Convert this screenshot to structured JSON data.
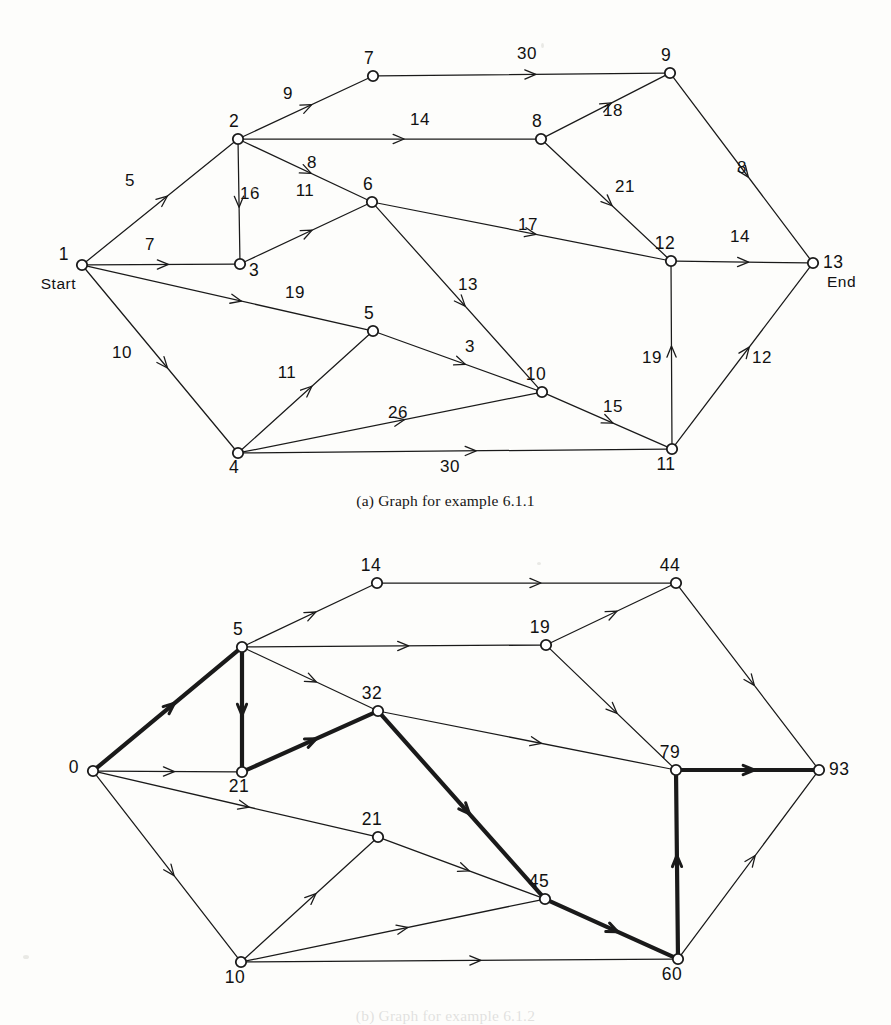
{
  "page": {
    "background_color": "#fdfdfb",
    "ink_color": "#1a1a1a",
    "width": 891,
    "height": 1025
  },
  "figure_a": {
    "caption": "(a) Graph for example 6.1.1",
    "terminal_labels": {
      "start": "Start",
      "end": "End"
    },
    "nodes": [
      {
        "id": "1",
        "label": "1",
        "x": 82,
        "y": 265,
        "label_dx": -13,
        "label_dy": -5,
        "terminal": "Start"
      },
      {
        "id": "2",
        "label": "2",
        "x": 238,
        "y": 139,
        "label_dx": -4,
        "label_dy": -12
      },
      {
        "id": "3",
        "label": "3",
        "x": 240,
        "y": 264,
        "label_dx": 9,
        "label_dy": 12
      },
      {
        "id": "4",
        "label": "4",
        "x": 238,
        "y": 453,
        "label_dx": -4,
        "label_dy": 20
      },
      {
        "id": "5",
        "label": "5",
        "x": 373,
        "y": 331,
        "label_dx": -4,
        "label_dy": -12
      },
      {
        "id": "6",
        "label": "6",
        "x": 372,
        "y": 202,
        "label_dx": -4,
        "label_dy": -12
      },
      {
        "id": "7",
        "label": "7",
        "x": 373,
        "y": 76,
        "label_dx": -4,
        "label_dy": -12
      },
      {
        "id": "8",
        "label": "8",
        "x": 541,
        "y": 139,
        "label_dx": -4,
        "label_dy": -12
      },
      {
        "id": "9",
        "label": "9",
        "x": 670,
        "y": 73,
        "label_dx": -4,
        "label_dy": -12
      },
      {
        "id": "10",
        "label": "10",
        "x": 542,
        "y": 392,
        "label_dx": -6,
        "label_dy": -12
      },
      {
        "id": "11",
        "label": "11",
        "x": 672,
        "y": 449,
        "label_dx": -6,
        "label_dy": 21
      },
      {
        "id": "12",
        "label": "12",
        "x": 671,
        "y": 261,
        "label_dx": -6,
        "label_dy": -12
      },
      {
        "id": "13",
        "label": "13",
        "x": 813,
        "y": 263,
        "label_dx": 10,
        "label_dy": 5,
        "terminal": "End"
      }
    ],
    "edges": [
      {
        "from": "1",
        "to": "2",
        "weight": "5",
        "wx": 130,
        "wy": 186
      },
      {
        "from": "1",
        "to": "3",
        "weight": "7",
        "wx": 150,
        "wy": 250
      },
      {
        "from": "1",
        "to": "5",
        "weight": "19",
        "wx": 295,
        "wy": 298
      },
      {
        "from": "1",
        "to": "4",
        "weight": "10",
        "wx": 122,
        "wy": 358
      },
      {
        "from": "2",
        "to": "7",
        "weight": "9",
        "wx": 288,
        "wy": 99
      },
      {
        "from": "2",
        "to": "8",
        "weight": "14",
        "wx": 420,
        "wy": 125
      },
      {
        "from": "2",
        "to": "6",
        "weight": "8",
        "wx": 312,
        "wy": 168
      },
      {
        "from": "2",
        "to": "3",
        "weight": "16",
        "wx": 250,
        "wy": 199
      },
      {
        "from": "3",
        "to": "6",
        "weight": "11",
        "wx": 305,
        "wy": 196
      },
      {
        "from": "4",
        "to": "5",
        "weight": "11",
        "wx": 287,
        "wy": 378
      },
      {
        "from": "4",
        "to": "10",
        "weight": "26",
        "wx": 398,
        "wy": 418
      },
      {
        "from": "4",
        "to": "11",
        "weight": "30",
        "wx": 450,
        "wy": 472
      },
      {
        "from": "5",
        "to": "10",
        "weight": "3",
        "wx": 470,
        "wy": 352
      },
      {
        "from": "6",
        "to": "12",
        "weight": "17",
        "wx": 528,
        "wy": 230
      },
      {
        "from": "6",
        "to": "10",
        "weight": "13",
        "wx": 468,
        "wy": 290
      },
      {
        "from": "7",
        "to": "9",
        "weight": "30",
        "wx": 527,
        "wy": 59
      },
      {
        "from": "8",
        "to": "9",
        "weight": "18",
        "wx": 613,
        "wy": 116
      },
      {
        "from": "8",
        "to": "12",
        "weight": "21",
        "wx": 625,
        "wy": 192
      },
      {
        "from": "9",
        "to": "13",
        "weight": "8",
        "wx": 742,
        "wy": 173
      },
      {
        "from": "10",
        "to": "11",
        "weight": "15",
        "wx": 613,
        "wy": 412
      },
      {
        "from": "11",
        "to": "12",
        "weight": "19",
        "wx": 652,
        "wy": 363
      },
      {
        "from": "11",
        "to": "13",
        "weight": "12",
        "wx": 762,
        "wy": 363
      },
      {
        "from": "12",
        "to": "13",
        "weight": "14",
        "wx": 740,
        "wy": 242
      }
    ]
  },
  "figure_b": {
    "caption": "(b) Graph for example 6.1.2",
    "nodes": [
      {
        "id": "n0",
        "label": "0",
        "x": 93,
        "y": 771,
        "label_dx": -14,
        "label_dy": 2
      },
      {
        "id": "n5",
        "label": "5",
        "x": 242,
        "y": 647,
        "label_dx": -4,
        "label_dy": -12
      },
      {
        "id": "n21a",
        "label": "21",
        "x": 242,
        "y": 772,
        "label_dx": -3,
        "label_dy": 20
      },
      {
        "id": "n14",
        "label": "14",
        "x": 377,
        "y": 583,
        "label_dx": -6,
        "label_dy": -12
      },
      {
        "id": "n32",
        "label": "32",
        "x": 378,
        "y": 711,
        "label_dx": -6,
        "label_dy": -12
      },
      {
        "id": "n21b",
        "label": "21",
        "x": 378,
        "y": 837,
        "label_dx": -6,
        "label_dy": -12
      },
      {
        "id": "n19",
        "label": "19",
        "x": 546,
        "y": 645,
        "label_dx": -6,
        "label_dy": -12
      },
      {
        "id": "n45",
        "label": "45",
        "x": 545,
        "y": 899,
        "label_dx": -6,
        "label_dy": -12
      },
      {
        "id": "n44",
        "label": "44",
        "x": 676,
        "y": 583,
        "label_dx": -6,
        "label_dy": -12
      },
      {
        "id": "n79",
        "label": "79",
        "x": 676,
        "y": 770,
        "label_dx": -6,
        "label_dy": -12
      },
      {
        "id": "n60",
        "label": "60",
        "x": 678,
        "y": 959,
        "label_dx": -6,
        "label_dy": 21
      },
      {
        "id": "n10",
        "label": "10",
        "x": 241,
        "y": 962,
        "label_dx": -6,
        "label_dy": 21
      },
      {
        "id": "n93",
        "label": "93",
        "x": 819,
        "y": 770,
        "label_dx": 10,
        "label_dy": 5
      }
    ],
    "edges": [
      {
        "from": "n0",
        "to": "n5",
        "bold": true
      },
      {
        "from": "n0",
        "to": "n21a",
        "bold": false
      },
      {
        "from": "n0",
        "to": "n21b",
        "bold": false
      },
      {
        "from": "n0",
        "to": "n10",
        "bold": false
      },
      {
        "from": "n5",
        "to": "n14",
        "bold": false
      },
      {
        "from": "n5",
        "to": "n19",
        "bold": false
      },
      {
        "from": "n5",
        "to": "n32",
        "bold": false
      },
      {
        "from": "n5",
        "to": "n21a",
        "bold": true
      },
      {
        "from": "n21a",
        "to": "n32",
        "bold": true
      },
      {
        "from": "n14",
        "to": "n44",
        "bold": false
      },
      {
        "from": "n32",
        "to": "n79",
        "bold": false
      },
      {
        "from": "n32",
        "to": "n45",
        "bold": true
      },
      {
        "from": "n21b",
        "to": "n45",
        "bold": false
      },
      {
        "from": "n10",
        "to": "n21b",
        "bold": false
      },
      {
        "from": "n10",
        "to": "n45",
        "bold": false
      },
      {
        "from": "n10",
        "to": "n60",
        "bold": false
      },
      {
        "from": "n19",
        "to": "n44",
        "bold": false
      },
      {
        "from": "n19",
        "to": "n79",
        "bold": false
      },
      {
        "from": "n44",
        "to": "n93",
        "bold": false
      },
      {
        "from": "n45",
        "to": "n60",
        "bold": true
      },
      {
        "from": "n60",
        "to": "n79",
        "bold": true
      },
      {
        "from": "n60",
        "to": "n93",
        "bold": false
      },
      {
        "from": "n79",
        "to": "n93",
        "bold": true
      }
    ],
    "critical_path": [
      "0",
      "5",
      "21",
      "32",
      "45",
      "60",
      "79",
      "93"
    ]
  }
}
